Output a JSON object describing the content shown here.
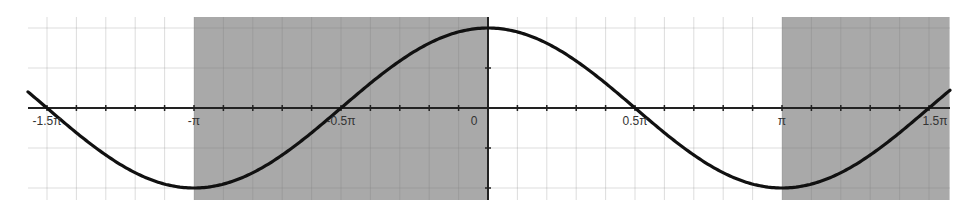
{
  "chart_data": {
    "type": "line",
    "title": "",
    "xlabel": "",
    "ylabel": "",
    "function": "cos(x)",
    "xlim": [
      -1.63,
      1.57
    ],
    "xlim_units": "pi",
    "ylim": [
      -1.15,
      1.15
    ],
    "grid": true,
    "minor_grid_step_pi": 0.1,
    "x_ticks": [
      {
        "value_pi": -1.5,
        "label": "-1.5π"
      },
      {
        "value_pi": -1.0,
        "label": "-π"
      },
      {
        "value_pi": -0.5,
        "label": "-0.5π"
      },
      {
        "value_pi": 0.0,
        "label": "0"
      },
      {
        "value_pi": 0.5,
        "label": "0.5π"
      },
      {
        "value_pi": 1.0,
        "label": "π"
      },
      {
        "value_pi": 1.5,
        "label": "1.5π"
      }
    ],
    "series": [
      {
        "name": "cos(x)",
        "color": "#111111",
        "x_pi": [
          -1.5,
          -1.0,
          -0.5,
          0.0,
          0.5,
          1.0,
          1.5
        ],
        "values": [
          0,
          -1,
          0,
          1,
          0,
          -1,
          0
        ]
      }
    ],
    "shaded_regions": [
      {
        "x_start_pi": -1.0,
        "x_end_pi": 0.0,
        "color": "#a9a9a9"
      },
      {
        "x_start_pi": 1.0,
        "x_end_pi": 1.57,
        "color": "#a9a9a9"
      }
    ],
    "legend": null
  },
  "colors": {
    "background": "#ffffff",
    "grid": "#dddddd",
    "axis": "#222222",
    "curve": "#111111",
    "shade": "#a9a9a9"
  }
}
